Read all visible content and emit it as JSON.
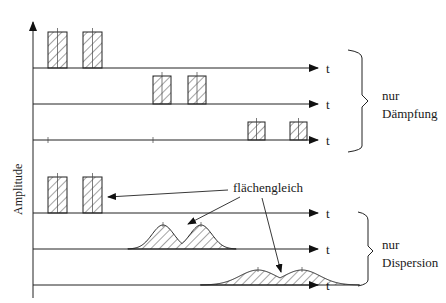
{
  "diagram": {
    "y_axis_label": "Amplitude",
    "time_axis_label": "t",
    "groups": [
      {
        "id": "daempfung",
        "label_lines": [
          "nur",
          "Dämpfung"
        ],
        "rows": [
          {
            "baseline_y": 68,
            "pulse_type": "rect",
            "pulses": [
              {
                "x": 48,
                "w": 19,
                "h": 36
              },
              {
                "x": 83,
                "w": 19,
                "h": 36
              }
            ]
          },
          {
            "baseline_y": 104,
            "pulse_type": "rect",
            "pulses": [
              {
                "x": 153,
                "w": 18,
                "h": 28
              },
              {
                "x": 188,
                "w": 18,
                "h": 28
              }
            ]
          },
          {
            "baseline_y": 140,
            "pulse_type": "rect",
            "pulses": [
              {
                "x": 248,
                "w": 17,
                "h": 18
              },
              {
                "x": 290,
                "w": 17,
                "h": 18
              }
            ]
          }
        ]
      },
      {
        "id": "dispersion",
        "label_lines": [
          "nur",
          "Dispersion"
        ],
        "rows": [
          {
            "baseline_y": 213,
            "pulse_type": "rect",
            "pulses": [
              {
                "x": 48,
                "w": 19,
                "h": 36
              },
              {
                "x": 83,
                "w": 19,
                "h": 36
              }
            ]
          },
          {
            "baseline_y": 249,
            "pulse_type": "gauss",
            "pulses": [
              {
                "cx": 163,
                "sigma": 11,
                "h": 24
              },
              {
                "cx": 201,
                "sigma": 11,
                "h": 24
              }
            ]
          },
          {
            "baseline_y": 285,
            "pulse_type": "gauss",
            "pulses": [
              {
                "cx": 258,
                "sigma": 18,
                "h": 15
              },
              {
                "cx": 302,
                "sigma": 18,
                "h": 15
              }
            ]
          }
        ]
      }
    ],
    "annotation": {
      "label": "flächengleich",
      "meaning": "equal area"
    }
  }
}
